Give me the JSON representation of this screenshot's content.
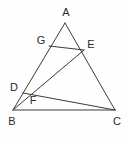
{
  "figure": {
    "background_color": "#fefefe",
    "line_color": "#3a3a3a",
    "label_color": "#2b2b2b",
    "points": {
      "A": {
        "label": "A",
        "x": 65,
        "y": 23,
        "label_x": 66,
        "label_y": 13
      },
      "B": {
        "label": "B",
        "x": 13,
        "y": 110,
        "label_x": 12,
        "label_y": 122
      },
      "C": {
        "label": "C",
        "x": 115,
        "y": 110,
        "label_x": 117,
        "label_y": 122
      },
      "D": {
        "label": "D",
        "x": 23,
        "y": 93,
        "label_x": 14,
        "label_y": 88
      },
      "E": {
        "label": "E",
        "x": 84,
        "y": 50,
        "label_x": 91,
        "label_y": 45
      },
      "F": {
        "label": "F",
        "x": 28,
        "y": 98,
        "label_x": 33,
        "label_y": 101
      },
      "G": {
        "label": "G",
        "x": 49,
        "y": 46,
        "label_x": 41,
        "label_y": 41
      }
    },
    "segments": [
      {
        "name": "side-AB",
        "from": "A",
        "to": "B"
      },
      {
        "name": "side-AC",
        "from": "A",
        "to": "C"
      },
      {
        "name": "side-BC",
        "from": "B",
        "to": "C"
      },
      {
        "name": "segment-GE",
        "from": "G",
        "to": "E"
      },
      {
        "name": "segment-BE",
        "from": "B",
        "to": "E"
      },
      {
        "name": "segment-DC",
        "from": "D",
        "to": "C"
      }
    ],
    "labels_order": [
      "A",
      "G",
      "E",
      "D",
      "F",
      "B",
      "C"
    ]
  }
}
